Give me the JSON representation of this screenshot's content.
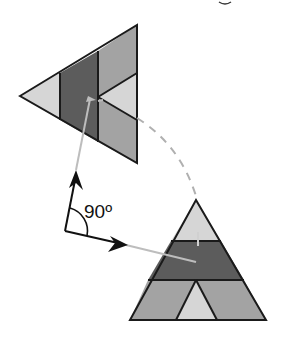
{
  "diagram": {
    "angle_label": "90º",
    "colors": {
      "outline": "#1a1a1a",
      "light": "#d6d6d6",
      "medium": "#a3a3a3",
      "dark": "#5c5c5c",
      "guide": "#bdbdbd",
      "arrow": "#111111"
    },
    "shapes": [
      {
        "name": "rotated-triangle",
        "orientation": "pointing-left"
      },
      {
        "name": "upright-triangle",
        "orientation": "pointing-up"
      }
    ],
    "annotations": [
      "right-angle-arrows",
      "dashed-rotation-arc",
      "90-degree-label"
    ]
  }
}
